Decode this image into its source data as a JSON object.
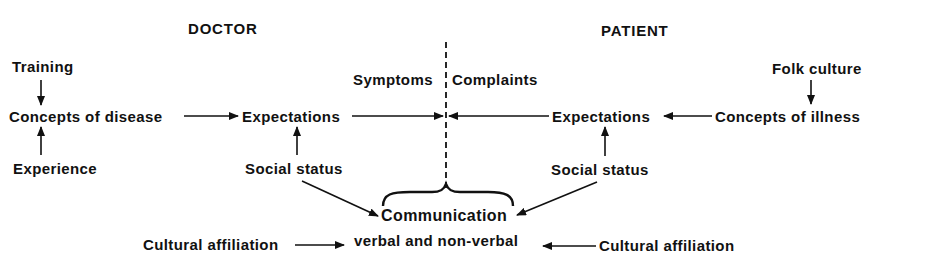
{
  "headers": {
    "doctor": "DOCTOR",
    "patient": "PATIENT"
  },
  "doctor": {
    "training": "Training",
    "concepts": "Concepts of disease",
    "experience": "Experience",
    "expectations": "Expectations",
    "social_status": "Social status",
    "cultural_affiliation": "Cultural affiliation"
  },
  "patient": {
    "folk_culture": "Folk culture",
    "concepts": "Concepts of illness",
    "expectations": "Expectations",
    "social_status": "Social status",
    "cultural_affiliation": "Cultural affiliation"
  },
  "divider": {
    "left_label": "Symptoms",
    "right_label": "Complaints"
  },
  "communication": {
    "title": "Communication",
    "subtitle": "verbal and non-verbal"
  },
  "colors": {
    "ink": "#111111",
    "background": "#ffffff"
  }
}
